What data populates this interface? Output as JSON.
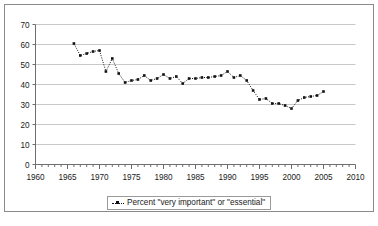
{
  "chart_data": {
    "type": "line",
    "title": "",
    "subtitle": "",
    "xlabel": "",
    "ylabel": "",
    "xlim": [
      1960,
      2010
    ],
    "ylim": [
      0,
      70
    ],
    "y_ticks": [
      0,
      10,
      20,
      30,
      40,
      50,
      60,
      70
    ],
    "x_ticks": [
      1960,
      1965,
      1970,
      1975,
      1980,
      1985,
      1990,
      1995,
      2000,
      2005,
      2010
    ],
    "x_minor_tick_step": 1,
    "grid": "horizontal",
    "legend_position": "bottom-center",
    "line_style": "dotted",
    "marker": "square",
    "marker_color": "#111111",
    "line_color": "#111111",
    "series": [
      {
        "name": "Percent \"very important\" or \"essential\"",
        "x": [
          1966,
          1967,
          1968,
          1969,
          1970,
          1971,
          1972,
          1973,
          1974,
          1975,
          1976,
          1977,
          1978,
          1979,
          1980,
          1981,
          1982,
          1983,
          1984,
          1985,
          1986,
          1987,
          1988,
          1989,
          1990,
          1991,
          1992,
          1993,
          1994,
          1995,
          1996,
          1997,
          1998,
          1999,
          2000,
          2001,
          2002,
          2003,
          2004,
          2005
        ],
        "values": [
          60.5,
          54.5,
          55.5,
          56.5,
          57.0,
          46.5,
          53.0,
          45.5,
          41.0,
          42.0,
          42.5,
          44.5,
          42.0,
          43.0,
          45.0,
          43.0,
          44.0,
          40.5,
          43.0,
          43.0,
          43.5,
          43.5,
          44.0,
          44.5,
          46.5,
          43.5,
          44.5,
          42.0,
          37.0,
          32.5,
          33.0,
          30.5,
          30.5,
          29.5,
          28.0,
          32.0,
          33.5,
          34.0,
          34.5,
          36.5
        ]
      }
    ]
  },
  "legend": {
    "entry_label": "Percent \"very important\" or \"essential\"",
    "marker_icon": "line-marker-icon"
  },
  "axes": {
    "y_tick_labels": [
      "0",
      "10",
      "20",
      "30",
      "40",
      "50",
      "60",
      "70"
    ],
    "x_tick_labels": [
      "1960",
      "1965",
      "1970",
      "1975",
      "1980",
      "1985",
      "1990",
      "1995",
      "2000",
      "2005",
      "2010"
    ]
  },
  "colors": {
    "frame": "#8a8a8a",
    "gridline": "#c8c8c8",
    "axis": "#6e6e6e",
    "series": "#111111",
    "background": "#ffffff",
    "text": "#1a1a1a"
  }
}
